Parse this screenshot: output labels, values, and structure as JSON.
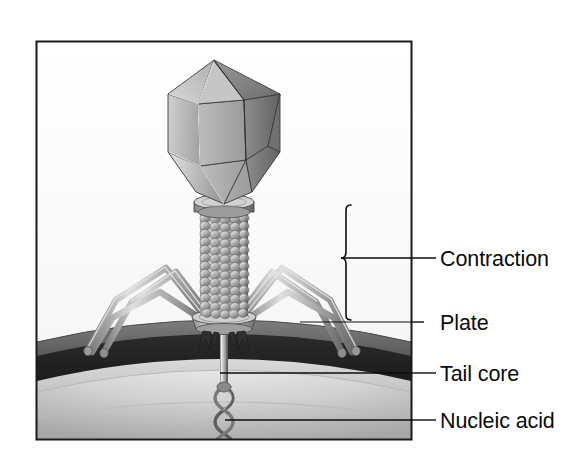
{
  "figure": {
    "frame": {
      "x": 36,
      "y": 41,
      "width": 376,
      "height": 399,
      "border_color": "#1a1a1a"
    },
    "background_color": "#ffffff"
  },
  "labels": [
    {
      "id": "contraction",
      "text": "Contraction",
      "x": 440,
      "y": 266,
      "leader": {
        "type": "brace",
        "from_x": 412,
        "to_x": 436,
        "y": 258
      }
    },
    {
      "id": "plate",
      "text": "Plate",
      "x": 440,
      "y": 330,
      "leader": {
        "type": "line",
        "from_x": 300,
        "to_x": 412,
        "y": 322
      }
    },
    {
      "id": "tail-core",
      "text": "Tail core",
      "x": 440,
      "y": 381,
      "leader": {
        "type": "line",
        "from_x": 220,
        "to_x": 500,
        "y": 373
      }
    },
    {
      "id": "nucleic-acid",
      "text": "Nucleic acid",
      "x": 440,
      "y": 428,
      "leader": {
        "type": "line",
        "from_x": 225,
        "to_x": 500,
        "y": 420
      }
    }
  ],
  "brace": {
    "x": 346,
    "top_y": 205,
    "bottom_y": 320,
    "tip_x": 412,
    "tip_y": 258
  },
  "structures": [
    {
      "name": "capsid-head",
      "description": "elongated icosahedral head",
      "cx": 224,
      "top_y": 50,
      "bottom_y": 200,
      "half_width": 56
    },
    {
      "name": "collar",
      "description": "neck collar disc",
      "cx": 224,
      "cy": 207,
      "rx": 30,
      "ry": 8
    },
    {
      "name": "tail-sheath",
      "description": "contractile beaded sheath",
      "cx": 224,
      "top_y": 212,
      "bottom_y": 312,
      "half_width": 23,
      "rings": 13,
      "beads_per_ring": 5
    },
    {
      "name": "base-plate",
      "description": "hexagonal base plate",
      "cx": 224,
      "cy": 322,
      "rx": 32,
      "ry": 9
    },
    {
      "name": "tail-pins",
      "description": "short spikes under the plate",
      "count": 4
    },
    {
      "name": "tail-fibers",
      "description": "long bent tail fibers / legs",
      "count": 6
    },
    {
      "name": "tail-core-tube",
      "description": "tail core penetrating the cell wall",
      "cx": 224,
      "top_y": 325,
      "bottom_y": 385,
      "width": 7
    },
    {
      "name": "nucleic-acid-helix",
      "description": "double helix DNA entering cell",
      "cx": 224,
      "top_y": 385,
      "bottom_y": 438
    },
    {
      "name": "cell-envelope",
      "description": "curved bacterial cell wall and membrane layers"
    }
  ],
  "colors": {
    "ink": "#0b0b0b",
    "frame": "#1a1a1a",
    "capsid_light": "#d6d6d6",
    "capsid_mid": "#a9a9a9",
    "capsid_dark": "#6f6f6f",
    "sheath_light": "#cfcfcf",
    "sheath_mid": "#9a9a9a",
    "sheath_dark": "#6a6a6a",
    "fiber_light": "#d9d9d9",
    "fiber_dark": "#7b7b7b",
    "wall_outer": "#6d6d6d",
    "wall_dark": "#262626",
    "wall_light": "#cfcfcf",
    "cytoplasm_light": "#e8e8e8",
    "cytoplasm_mid": "#b3b3b3",
    "sky": "#fbfbfb"
  }
}
